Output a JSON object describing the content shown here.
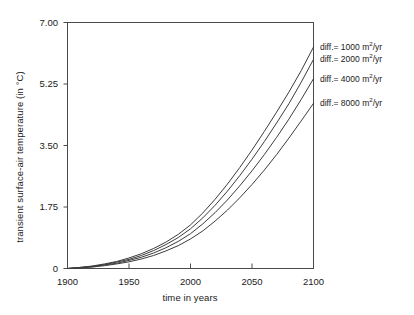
{
  "chart_data": {
    "type": "line",
    "title": "",
    "xlabel": "time in years",
    "ylabel": "transient surface-air temperature (in °C)",
    "xlim": [
      1900,
      2100
    ],
    "ylim": [
      0,
      7.0
    ],
    "grid": false,
    "legend_position": "right-inside-plot-edge",
    "xticks": [
      1900,
      1950,
      2000,
      2050,
      2100
    ],
    "xtick_labels": [
      "1900",
      "1950",
      "2000",
      "2050",
      "2100"
    ],
    "yticks": [
      0,
      1.75,
      3.5,
      5.25,
      7.0
    ],
    "ytick_labels": [
      "0",
      "1.75",
      "3.50",
      "5.25",
      "7.00"
    ],
    "x": [
      1900,
      1910,
      1920,
      1930,
      1940,
      1950,
      1960,
      1970,
      1980,
      1990,
      2000,
      2010,
      2020,
      2030,
      2040,
      2050,
      2060,
      2070,
      2080,
      2090,
      2100
    ],
    "series": [
      {
        "name": "diff.= 1000 m2/yr",
        "label_prefix": "diff.= ",
        "value": "1000",
        "unit_base": "m",
        "unit_exp": "2",
        "unit_suffix": "/yr",
        "color": "#3c3c3c",
        "final_value": 6.3,
        "values": [
          0.0,
          0.03,
          0.07,
          0.13,
          0.2,
          0.3,
          0.42,
          0.57,
          0.75,
          0.97,
          1.24,
          1.58,
          1.97,
          2.4,
          2.87,
          3.37,
          3.9,
          4.45,
          5.02,
          5.63,
          6.3
        ]
      },
      {
        "name": "diff.= 2000 m2/yr",
        "label_prefix": "diff.= ",
        "value": "2000",
        "unit_base": "m",
        "unit_exp": "2",
        "unit_suffix": "/yr",
        "color": "#3c3c3c",
        "final_value": 5.95,
        "values": [
          0.0,
          0.03,
          0.06,
          0.11,
          0.18,
          0.26,
          0.37,
          0.51,
          0.68,
          0.88,
          1.13,
          1.44,
          1.8,
          2.2,
          2.64,
          3.11,
          3.61,
          4.14,
          4.69,
          5.3,
          5.95
        ]
      },
      {
        "name": "diff.= 4000 m2/yr",
        "label_prefix": "diff.= ",
        "value": "4000",
        "unit_base": "m",
        "unit_exp": "2",
        "unit_suffix": "/yr",
        "color": "#3c3c3c",
        "final_value": 5.4,
        "values": [
          0.0,
          0.02,
          0.05,
          0.1,
          0.15,
          0.23,
          0.32,
          0.44,
          0.59,
          0.77,
          0.99,
          1.27,
          1.59,
          1.95,
          2.35,
          2.78,
          3.24,
          3.73,
          4.25,
          4.81,
          5.4
        ]
      },
      {
        "name": "diff.= 8000 m2/yr",
        "label_prefix": "diff.= ",
        "value": "8000",
        "unit_base": "m",
        "unit_exp": "2",
        "unit_suffix": "/yr",
        "color": "#3c3c3c",
        "final_value": 4.7,
        "values": [
          0.0,
          0.02,
          0.04,
          0.08,
          0.13,
          0.19,
          0.27,
          0.37,
          0.5,
          0.65,
          0.84,
          1.07,
          1.35,
          1.66,
          2.01,
          2.39,
          2.8,
          3.24,
          3.71,
          4.2,
          4.7
        ]
      }
    ],
    "axis_color": "#4a4a4a",
    "background": "#ffffff"
  }
}
